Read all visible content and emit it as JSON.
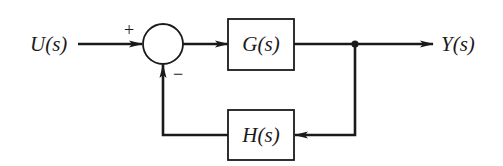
{
  "diagram": {
    "type": "feedback-control-block-diagram",
    "input": {
      "label": "U(s)"
    },
    "output": {
      "label": "Y(s)"
    },
    "summing_junction": {
      "plus_sign": "+",
      "minus_sign": "−"
    },
    "forward_block": {
      "label": "G(s)"
    },
    "feedback_block": {
      "label": "H(s)"
    },
    "colors": {
      "ink": "#1a1a1a",
      "background": "#ffffff"
    }
  }
}
